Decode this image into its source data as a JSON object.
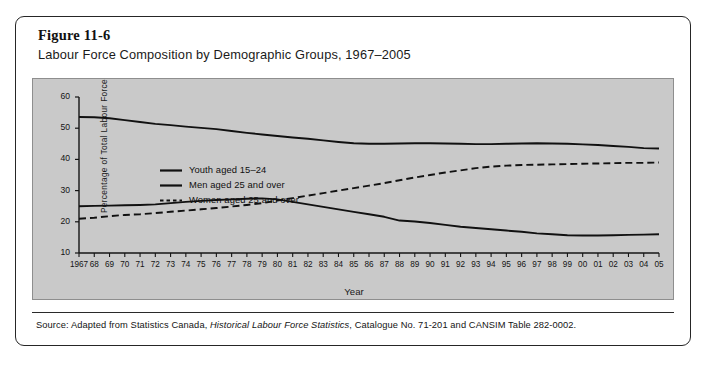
{
  "figure": {
    "number": "Figure 11-6",
    "title": "Labour Force Composition by Demographic Groups, 1967–2005"
  },
  "source": {
    "prefix": "Source: Adapted from Statistics Canada, ",
    "italic": "Historical Labour Force Statistics",
    "suffix": ", Catalogue No. 71-201 and CANSIM Table 282-0002."
  },
  "chart_data": {
    "type": "line",
    "title": "Labour Force Composition by Demographic Groups, 1967–2005",
    "xlabel": "Year",
    "ylabel": "Percentage of Total Labour Force",
    "ylim": [
      10,
      60
    ],
    "yticks": [
      10,
      20,
      30,
      40,
      50,
      60
    ],
    "grid": false,
    "legend_position": "upper-left-inside",
    "x": [
      1967,
      1968,
      1969,
      1970,
      1971,
      1972,
      1973,
      1974,
      1975,
      1976,
      1977,
      1978,
      1979,
      1980,
      1981,
      1982,
      1983,
      1984,
      1985,
      1986,
      1987,
      1988,
      1989,
      1990,
      1991,
      1992,
      1993,
      1994,
      1995,
      1996,
      1997,
      1998,
      1999,
      2000,
      2001,
      2002,
      2003,
      2004,
      2005
    ],
    "xtick_labels": [
      "1967",
      "68",
      "69",
      "70",
      "71",
      "72",
      "73",
      "74",
      "75",
      "76",
      "77",
      "78",
      "79",
      "80",
      "81",
      "82",
      "83",
      "84",
      "85",
      "86",
      "87",
      "88",
      "89",
      "90",
      "91",
      "92",
      "93",
      "94",
      "95",
      "96",
      "97",
      "98",
      "99",
      "00",
      "01",
      "02",
      "03",
      "04",
      "05"
    ],
    "series": [
      {
        "name": "Youth aged 15–24",
        "style": "solid",
        "color": "#111111",
        "values": [
          25.0,
          25.1,
          25.2,
          25.3,
          25.4,
          25.6,
          26.0,
          26.4,
          26.7,
          27.0,
          27.2,
          27.4,
          27.5,
          27.2,
          26.4,
          25.6,
          24.8,
          24.0,
          23.2,
          22.4,
          21.6,
          20.4,
          20.1,
          19.6,
          19.0,
          18.4,
          18.0,
          17.6,
          17.2,
          16.8,
          16.3,
          16.0,
          15.7,
          15.6,
          15.6,
          15.7,
          15.8,
          15.9,
          16.0
        ]
      },
      {
        "name": "Men aged 25 and over",
        "style": "solid",
        "color": "#111111",
        "values": [
          53.6,
          53.5,
          53.2,
          52.6,
          52.0,
          51.4,
          51.0,
          50.5,
          50.1,
          49.7,
          49.1,
          48.5,
          48.0,
          47.5,
          47.0,
          46.6,
          46.1,
          45.6,
          45.2,
          45.0,
          45.0,
          45.1,
          45.2,
          45.2,
          45.1,
          45.0,
          44.9,
          44.9,
          45.0,
          45.1,
          45.2,
          45.1,
          45.0,
          44.8,
          44.6,
          44.3,
          44.0,
          43.6,
          43.5
        ]
      },
      {
        "name": "Women aged 25 and over",
        "style": "dashed",
        "color": "#111111",
        "values": [
          21.0,
          21.3,
          21.8,
          22.2,
          22.4,
          22.8,
          23.2,
          23.6,
          24.0,
          24.4,
          24.9,
          25.4,
          26.0,
          26.8,
          27.6,
          28.4,
          29.2,
          30.0,
          30.8,
          31.6,
          32.4,
          33.3,
          34.2,
          35.0,
          35.8,
          36.5,
          37.2,
          37.7,
          38.0,
          38.2,
          38.3,
          38.4,
          38.5,
          38.6,
          38.7,
          38.8,
          38.9,
          38.9,
          39.0
        ]
      }
    ]
  }
}
